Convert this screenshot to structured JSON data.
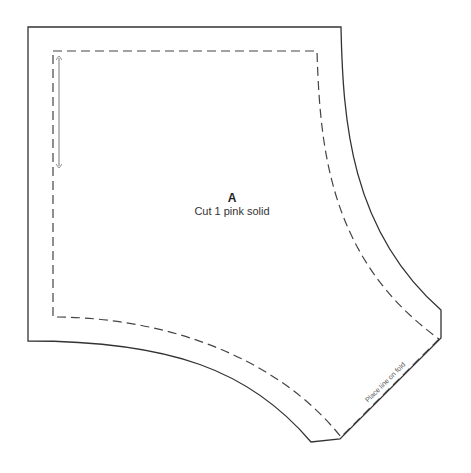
{
  "pattern_piece": {
    "letter": "A",
    "instruction": "Cut 1 pink solid",
    "fold_label": "Place line on fold"
  },
  "colors": {
    "background": "#ffffff",
    "cut_line": "#333333",
    "seam_line": "#444444",
    "grain_line": "#555555"
  }
}
